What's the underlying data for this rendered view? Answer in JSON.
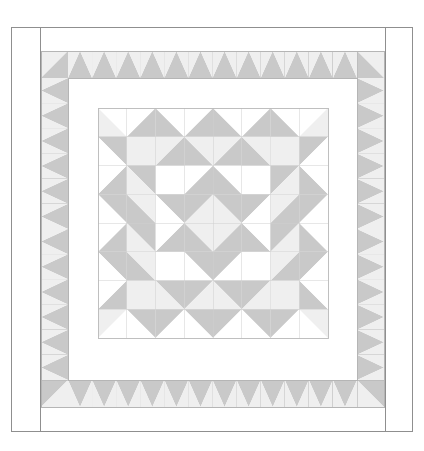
{
  "page": {
    "width": 424,
    "height": 451,
    "background": "#ffffff"
  },
  "rule": {
    "name": "top-divider",
    "color": "#d9d9d9",
    "y": 6
  },
  "palette": {
    "background": "#ffffff",
    "white": "#ffffff",
    "light_gray": "#efefef",
    "pale_gray": "#f4f4f4",
    "medium_gray": "#c9c9c9",
    "grid_line": "#cfcfcf",
    "frame_line": "#8f8f8f",
    "inner_line": "#b5b5b5"
  },
  "quilt": {
    "name": "medallion-star-quilt",
    "outer_frame": {
      "x": 11,
      "y": 27,
      "width": 401,
      "height": 404,
      "stroke": "#8f8f8f",
      "fill": "#ffffff"
    },
    "binding_left_line_x": 40,
    "binding_right_line_x": 385,
    "inner_panel": {
      "x": 40,
      "y": 27,
      "width": 345,
      "height": 404,
      "stroke": "#8f8f8f"
    },
    "outer_sawtooth_band": {
      "x": 41,
      "y": 51,
      "width": 343,
      "height": 356,
      "unit": 27,
      "stroke": "#b5b5b5"
    },
    "plain_border_band": {
      "x": 68,
      "y": 78,
      "width": 289,
      "height": 302,
      "fill": "#ffffff"
    },
    "center_block": {
      "x": 98,
      "y": 108,
      "width": 230,
      "height": 230,
      "cells": 8,
      "cell": 28.75
    },
    "center_block_label": "eight-pointed star medallion with flying-geese border",
    "outer_sawtooth_counts": {
      "top": 12,
      "bottom": 12,
      "left": 12,
      "right": 12
    }
  },
  "center_block_grid": {
    "rows": 8,
    "cols": 8,
    "description": "8x8 half-square-triangle grid forming an eight-pointed star with sawtooth ring"
  },
  "legend": {
    "fabrics": [
      {
        "name": "background-white",
        "color": "#ffffff"
      },
      {
        "name": "light-accent",
        "color": "#efefef"
      },
      {
        "name": "medium-accent",
        "color": "#c9c9c9"
      }
    ]
  }
}
